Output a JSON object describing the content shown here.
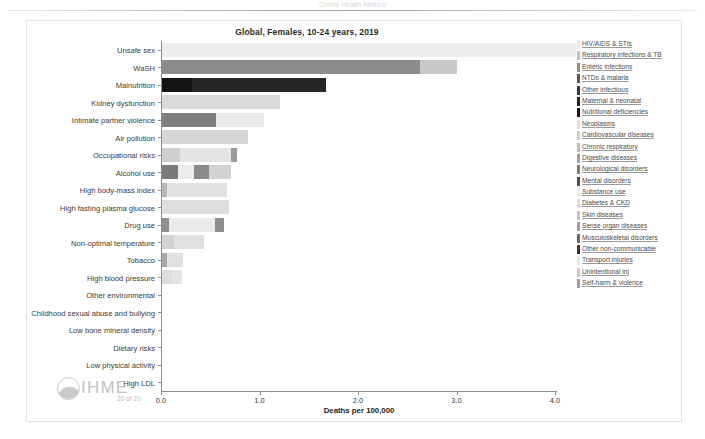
{
  "header": {
    "remnant_text": "Global Health Metrics"
  },
  "chart_title": "Global, Females, 10-24 years, 2019",
  "footer": {
    "logo_text": "IHME",
    "page_number": "20 of 20"
  },
  "legend": {
    "items": [
      {
        "label": "HIV/AIDS & STIs",
        "color": "#ededed"
      },
      {
        "label": "Respiratory infections & TB",
        "color": "#c2c2c2"
      },
      {
        "label": "Enteric infections",
        "color": "#8c8c8c"
      },
      {
        "label": "NTDs & malaria",
        "color": "#5a5a5a"
      },
      {
        "label": "Other infectious",
        "color": "#3d3d3d"
      },
      {
        "label": "Maternal & neonatal",
        "color": "#252525"
      },
      {
        "label": "Nutritional deficiencies",
        "color": "#151515"
      },
      {
        "label": "Neoplasms",
        "color": "#e2e2e2"
      },
      {
        "label": "Cardiovascular diseases",
        "color": "#cfcfcf"
      },
      {
        "label": "Chronic respiratory",
        "color": "#bcbcbc"
      },
      {
        "label": "Digestive diseases",
        "color": "#a0a0a0"
      },
      {
        "label": "Neurological disorders",
        "color": "#7d7d7d"
      },
      {
        "label": "Mental disorders",
        "color": "#4e4e4e"
      },
      {
        "label": "Substance use",
        "color": "#ededed"
      },
      {
        "label": "Diabetes & CKD",
        "color": "#dcdcdc"
      },
      {
        "label": "Skin diseases",
        "color": "#c4c4c4"
      },
      {
        "label": "Sense organ diseases",
        "color": "#9d9d9d"
      },
      {
        "label": "Musculoskeletal disorders",
        "color": "#6d6d6d"
      },
      {
        "label": "Other non-communicable",
        "color": "#3a3a3a"
      },
      {
        "label": "Transport injuries",
        "color": "#e6e6e6"
      },
      {
        "label": "Unintentional inj",
        "color": "#cccccc"
      },
      {
        "label": "Self-harm & violence",
        "color": "#9e9e9e"
      }
    ]
  },
  "chart_data": {
    "type": "bar",
    "orientation": "horizontal",
    "stacked": true,
    "title": "Global, Females, 10-24 years, 2019",
    "xlabel": "Deaths per 100,000",
    "ylabel": "",
    "xlim": [
      0.0,
      4.2
    ],
    "xticks": [
      "0.0",
      "1.0",
      "2.0",
      "3.0",
      "4.0"
    ],
    "xtick_values": [
      0.0,
      1.0,
      2.0,
      3.0,
      4.0
    ],
    "grid": false,
    "legend_position": "right",
    "categories": [
      "Unsafe sex",
      "WaSH",
      "Malnutrition",
      "Kidney dysfunction",
      "Intimate partner violence",
      "Air pollution",
      "Occupational risks",
      "Alcohol use",
      "High body-mass index",
      "High fasting plasma glucose",
      "Drug use",
      "Non-optimal temperature",
      "Tobacco",
      "High blood pressure",
      "Other environmental",
      "Childhood sexual abuse and bullying",
      "Low bone mineral density",
      "Dietary risks",
      "Low physical activity",
      "High LDL"
    ],
    "bars": [
      {
        "category": "Unsafe sex",
        "total": 4.2,
        "segments": [
          {
            "cause": "HIV/AIDS & STIs",
            "value": 4.2,
            "color": "#ededed"
          }
        ]
      },
      {
        "category": "WaSH",
        "total": 3.0,
        "segments": [
          {
            "cause": "Enteric infections",
            "value": 2.62,
            "color": "#8c8c8c"
          },
          {
            "cause": "Respiratory infections & TB",
            "value": 0.38,
            "color": "#c8c8c8"
          }
        ]
      },
      {
        "category": "Malnutrition",
        "total": 1.67,
        "segments": [
          {
            "cause": "Nutritional deficiencies",
            "value": 0.3,
            "color": "#131313"
          },
          {
            "cause": "Maternal & neonatal",
            "value": 1.37,
            "color": "#262626"
          }
        ]
      },
      {
        "category": "Kidney dysfunction",
        "total": 1.2,
        "segments": [
          {
            "cause": "Diabetes & CKD",
            "value": 1.2,
            "color": "#d9d9d9"
          }
        ]
      },
      {
        "category": "Intimate partner violence",
        "total": 1.04,
        "segments": [
          {
            "cause": "Self-harm & violence",
            "value": 0.55,
            "color": "#7f7f7f"
          },
          {
            "cause": "Mental disorders",
            "value": 0.49,
            "color": "#ebebeb"
          }
        ]
      },
      {
        "category": "Air pollution",
        "total": 0.87,
        "segments": [
          {
            "cause": "Respiratory infections & TB",
            "value": 0.87,
            "color": "#d6d6d6"
          }
        ]
      },
      {
        "category": "Occupational risks",
        "total": 0.76,
        "segments": [
          {
            "cause": "Unintentional inj",
            "value": 0.18,
            "color": "#cfcfcf"
          },
          {
            "cause": "Chronic respiratory",
            "value": 0.52,
            "color": "#e4e4e4"
          },
          {
            "cause": "Musculoskeletal disorders",
            "value": 0.06,
            "color": "#9a9a9a"
          }
        ]
      },
      {
        "category": "Alcohol use",
        "total": 0.7,
        "segments": [
          {
            "cause": "Transport injuries",
            "value": 0.16,
            "color": "#7a7a7a"
          },
          {
            "cause": "Self-harm & violence",
            "value": 0.16,
            "color": "#ececec"
          },
          {
            "cause": "Other non-communicable",
            "value": 0.16,
            "color": "#8a8a8a"
          },
          {
            "cause": "Digestive diseases",
            "value": 0.22,
            "color": "#d2d2d2"
          }
        ]
      },
      {
        "category": "High body-mass index",
        "total": 0.66,
        "segments": [
          {
            "cause": "Cardiovascular diseases",
            "value": 0.05,
            "color": "#b8b8b8"
          },
          {
            "cause": "Diabetes & CKD",
            "value": 0.61,
            "color": "#e2e2e2"
          }
        ]
      },
      {
        "category": "High fasting plasma glucose",
        "total": 0.68,
        "segments": [
          {
            "cause": "Diabetes & CKD",
            "value": 0.68,
            "color": "#dedede"
          }
        ]
      },
      {
        "category": "Drug use",
        "total": 0.63,
        "segments": [
          {
            "cause": "Substance use",
            "value": 0.07,
            "color": "#8f8f8f"
          },
          {
            "cause": "HIV/AIDS & STIs",
            "value": 0.47,
            "color": "#ebebeb"
          },
          {
            "cause": "Self-harm & violence",
            "value": 0.09,
            "color": "#8f8f8f"
          }
        ]
      },
      {
        "category": "Non-optimal temperature",
        "total": 0.43,
        "segments": [
          {
            "cause": "Cardiovascular diseases",
            "value": 0.12,
            "color": "#d2d2d2"
          },
          {
            "cause": "Respiratory infections & TB",
            "value": 0.31,
            "color": "#e0e0e0"
          }
        ]
      },
      {
        "category": "Tobacco",
        "total": 0.21,
        "segments": [
          {
            "cause": "Other non-communicable",
            "value": 0.05,
            "color": "#a8a8a8"
          },
          {
            "cause": "Respiratory infections & TB",
            "value": 0.16,
            "color": "#e0e0e0"
          }
        ]
      },
      {
        "category": "High blood pressure",
        "total": 0.2,
        "segments": [
          {
            "cause": "Cardiovascular diseases",
            "value": 0.1,
            "color": "#dcdcdc"
          },
          {
            "cause": "Diabetes & CKD",
            "value": 0.1,
            "color": "#e4e4e4"
          }
        ]
      },
      {
        "category": "Other environmental",
        "total": 0.0,
        "segments": []
      },
      {
        "category": "Childhood sexual abuse and bullying",
        "total": 0.0,
        "segments": []
      },
      {
        "category": "Low bone mineral density",
        "total": 0.0,
        "segments": []
      },
      {
        "category": "Dietary risks",
        "total": 0.0,
        "segments": []
      },
      {
        "category": "Low physical activity",
        "total": 0.0,
        "segments": []
      },
      {
        "category": "High LDL",
        "total": 0.0,
        "segments": []
      }
    ]
  }
}
